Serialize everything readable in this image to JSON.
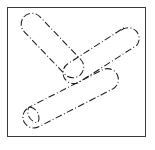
{
  "figure": {
    "title": "",
    "frame": {
      "border_color": "#3a3a3a",
      "background_color": "#ffffff",
      "x": 7,
      "y": 7,
      "width": 139,
      "height": 130
    },
    "caption": "",
    "drawing": {
      "description": "Three-armed capsule outline forming a K / arrow shape",
      "line_style": "dash-dot",
      "stroke_color": "#1a1a1a",
      "stroke_width": 1,
      "fill": "none",
      "arm_half_width": 11,
      "arms": [
        {
          "name": "upper-left-arm",
          "from_x": 32,
          "from_y": 24,
          "to_x": 72,
          "to_y": 66
        },
        {
          "name": "upper-right-arm",
          "from_x": 130,
          "from_y": 38,
          "to_x": 72,
          "to_y": 74
        },
        {
          "name": "lower-left-arm",
          "from_x": 34,
          "from_y": 114,
          "to_x": 104,
          "to_y": 78
        }
      ]
    }
  }
}
